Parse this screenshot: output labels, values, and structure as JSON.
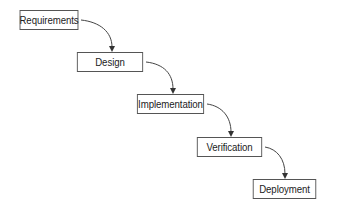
{
  "diagram": {
    "type": "waterfall-process",
    "steps": [
      {
        "label": "Requirements"
      },
      {
        "label": "Design"
      },
      {
        "label": "Implementation"
      },
      {
        "label": "Verification"
      },
      {
        "label": "Deployment"
      }
    ],
    "edges": [
      {
        "from": "Requirements",
        "to": "Design"
      },
      {
        "from": "Design",
        "to": "Implementation"
      },
      {
        "from": "Implementation",
        "to": "Verification"
      },
      {
        "from": "Verification",
        "to": "Deployment"
      }
    ],
    "colors": {
      "border": "#555555",
      "text": "#222222",
      "arrow": "#333333",
      "background": "#ffffff"
    }
  }
}
